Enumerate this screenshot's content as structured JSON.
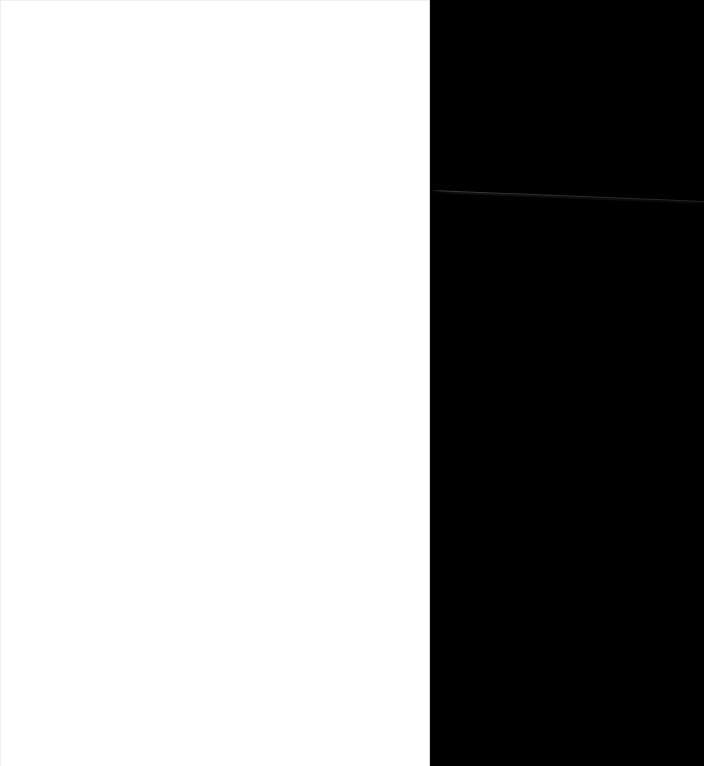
{
  "screenshot": {
    "width": 704,
    "height": 766,
    "state_label": "blank",
    "description": "Blank split capture: empty white content panel on the left, solid black panel on the right with a single faint diagonal hairline artifact."
  },
  "colors": {
    "left_panel_background": "#FFFFFF",
    "right_panel_background": "#000000",
    "panel_seam": "#D9D9DC",
    "left_panel_edge": "#F0F0F1",
    "hairline_artifact": "#3E3E3E",
    "hairline_shadow": "#1E1E1E"
  },
  "left_panel": {
    "name": "content-panel",
    "x": 0,
    "y": 0,
    "width": 430,
    "height": 766,
    "background": "#FFFFFF",
    "content": "",
    "content_note": "No text, icons, controls or imagery rendered.",
    "canvas_label": ""
  },
  "right_panel": {
    "name": "dark-panel",
    "x": 430,
    "y": 0,
    "width": 274,
    "height": 766,
    "background": "#000000",
    "content": "",
    "content_note": "Uniform black fill; no text or UI chrome rendered."
  },
  "artifacts": {
    "hairline": {
      "name": "diagonal-hairline",
      "start_x": 432,
      "start_y": 190,
      "end_x": 704,
      "end_y": 201,
      "thickness_px": 1,
      "color": "#3E3E3E",
      "angle_degrees": 2.32
    }
  },
  "seam": {
    "name": "panel-divider",
    "x": 429,
    "width": 1,
    "color": "#D9D9DC"
  }
}
